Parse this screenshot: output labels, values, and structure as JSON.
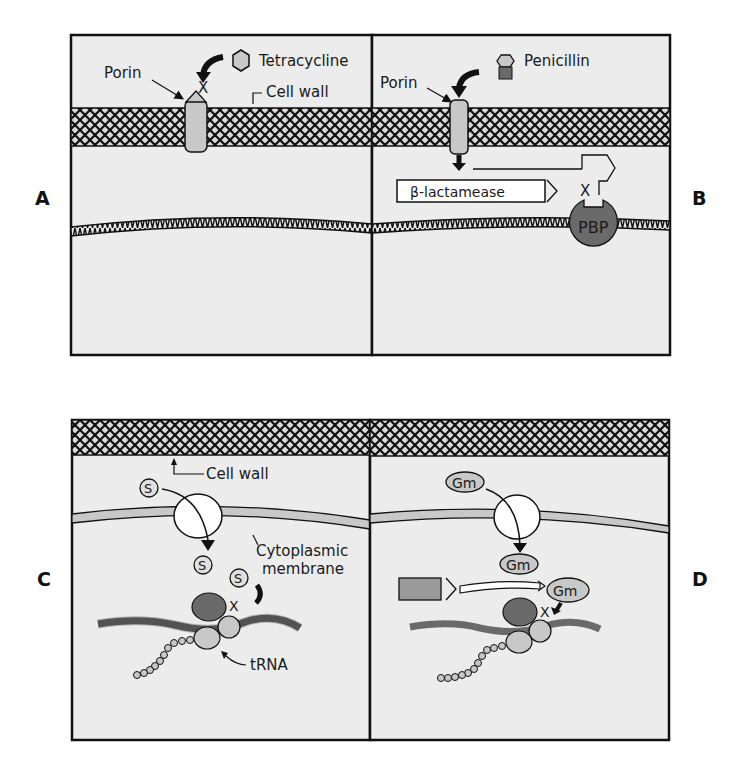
{
  "figure": {
    "colors": {
      "background": "#ffffff",
      "panel_fill": "#ececec",
      "outline": "#111111",
      "light_gray": "#c8c8c8",
      "medium_gray": "#9a9a9a",
      "dark_gray": "#6a6a6a"
    }
  },
  "panels": {
    "A": {
      "letter": "A",
      "drug_label": "Tetracycline",
      "porin_label": "Porin",
      "cell_wall_label": "Cell wall",
      "block_mark": "X"
    },
    "B": {
      "letter": "B",
      "drug_label": "Penicillin",
      "porin_label": "Porin",
      "enzyme_label": "β-lactamease",
      "target_label": "PBP",
      "block_mark": "X"
    },
    "C": {
      "letter": "C",
      "cell_wall_label": "Cell wall",
      "membrane_label_line1": "Cytoplasmic",
      "membrane_label_line2": "membrane",
      "drug_symbol": "S",
      "trna_label": "tRNA",
      "block_mark": "X"
    },
    "D": {
      "letter": "D",
      "drug_symbol": "Gm",
      "block_mark": "X"
    }
  }
}
